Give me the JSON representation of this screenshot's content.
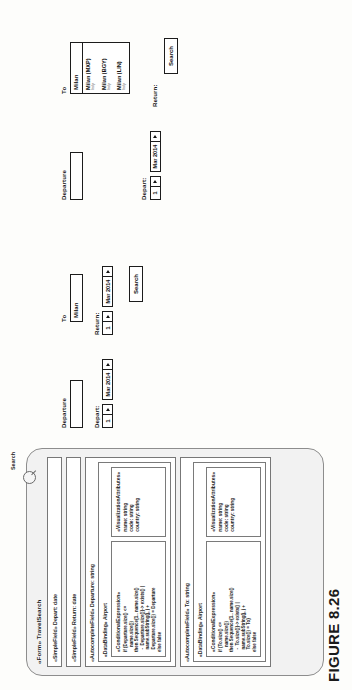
{
  "figure": {
    "caption": "FIGURE 8.26"
  },
  "model": {
    "title": "«Form» TravelSearch",
    "search_annotation": {
      "label": "Search",
      "icon": "search-icon"
    },
    "simple_fields": [
      {
        "label": "«SimpleField» Depart: date"
      },
      {
        "label": "«SimpleField» Return: date"
      }
    ],
    "autocomplete_fields": [
      {
        "title": "«AutocompleteField» Departure: string",
        "binding_title": "«DataBinding» Airport",
        "condition_title": "«ConditionalExpression»",
        "condition_code": "if (Departure.size() <=\n    name.size())\nthen Sequence{1.. name.size()\n  -  Departure.size()}-> exists() |\n  name.subString(j, j +\n  Departure.size()) = Departure\nelse false",
        "attributes_title": "«VisualizationAttributes»",
        "attributes": [
          "name: string",
          "code: string",
          "country: string"
        ]
      },
      {
        "title": "«AutocompleteField» To: string",
        "binding_title": "«DataBinding» Airport",
        "condition_title": "«ConditionalExpression»",
        "condition_code": "if (To.size() <=\n    name.size())\nthen Sequence{1.. name.size()\n  -  To.size()}-> exists() |\n  name.subString(j, j +\n  To.size()) = To}\nelse false",
        "attributes_title": "«VisualizationAttributes»",
        "attributes": [
          "name: string",
          "code: string",
          "country: string"
        ]
      }
    ]
  },
  "mockup_before": {
    "departure": {
      "label": "Departure",
      "value": ""
    },
    "to": {
      "label": "To",
      "value": "Milan"
    },
    "depart": {
      "label": "Depart:",
      "day": "1",
      "month_year": "Mar 2014"
    },
    "return": {
      "label": "Return:",
      "day": "1",
      "month_year": "Mar 2014"
    },
    "search_button": "Search"
  },
  "mockup_after": {
    "departure": {
      "label": "Departure",
      "value": ""
    },
    "to": {
      "label": "To",
      "value": "Milan"
    },
    "depart": {
      "label": "Depart:",
      "day": "1",
      "month_year": "Mar 2014"
    },
    "return": {
      "label": "Return:",
      "day": "1",
      "month_year": "Mar 2014"
    },
    "search_button": "Search",
    "autocomplete_suggestions": [
      {
        "name": "Milan (MXP)",
        "country": "Italy"
      },
      {
        "name": "Milan (BGY)",
        "country": "Italy"
      },
      {
        "name": "Milan (LIN)",
        "country": "Italy"
      }
    ]
  }
}
